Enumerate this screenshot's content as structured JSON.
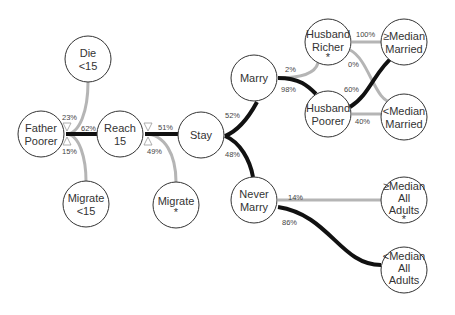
{
  "diagram": {
    "nodes": {
      "die": {
        "lines": [
          "Die",
          "<15"
        ]
      },
      "father": {
        "lines": [
          "Father",
          "Poorer"
        ]
      },
      "reach": {
        "lines": [
          "Reach",
          "15"
        ]
      },
      "migrate15": {
        "lines": [
          "Migrate",
          "<15"
        ]
      },
      "stay": {
        "lines": [
          "Stay"
        ]
      },
      "migrate": {
        "lines": [
          "Migrate",
          "*"
        ]
      },
      "marry": {
        "lines": [
          "Marry"
        ]
      },
      "never": {
        "lines": [
          "Never",
          "Marry"
        ]
      },
      "hrich": {
        "lines": [
          "Husband",
          "Richer",
          "*"
        ]
      },
      "hpoor": {
        "lines": [
          "Husband",
          "Poorer"
        ]
      },
      "gemm": {
        "lines": [
          "≥Median",
          "Married"
        ]
      },
      "ltmm": {
        "lines": [
          "<Median",
          "Married"
        ]
      },
      "gema": {
        "lines": [
          "≥Median",
          "All",
          "Adults",
          "*"
        ]
      },
      "ltma": {
        "lines": [
          "<Median",
          "All",
          "Adults"
        ]
      }
    },
    "edges": {
      "father_die": "23%",
      "father_reach": "62%",
      "father_migrate15": "15%",
      "reach_stay": "51%",
      "reach_migrate": "49%",
      "stay_marry": "52%",
      "stay_never": "48%",
      "marry_hrich": "2%",
      "marry_hpoor": "98%",
      "hrich_gemm": "100%",
      "hrich_ltmm": "0%",
      "hpoor_gemm": "60%",
      "hpoor_ltmm": "40%",
      "never_gema": "14%",
      "never_ltma": "86%"
    },
    "colors": {
      "thick": "#111111",
      "thin": "#b5b5b5",
      "node_stroke": "#333333"
    }
  }
}
